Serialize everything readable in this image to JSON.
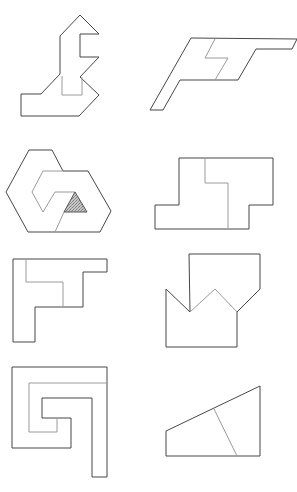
{
  "figure": {
    "colors": {
      "background": "#ffffff",
      "outline": "#474747",
      "inner_line": "#9a9a9a",
      "shaded_fill": "#b8b8b8"
    },
    "shapes": [
      {
        "id": "shape-1",
        "outline": "80,15 99,34 80,34 80,57 99,57 80,77 99,95 79,116 21,116 21,94 41,94 60,74 60,36",
        "inner": [
          "62,76 62,95 82,95 82,77"
        ]
      },
      {
        "id": "shape-2",
        "outline": "191,38 297,39 292,49 256,49 238,80 180,80 163,110 150,110",
        "inner": [
          "215,39 205,58 228,58 215,80"
        ]
      },
      {
        "id": "shape-3",
        "outline": "29,150 52,150 63,171 88,171 111,211 100,232 28,232 6,192",
        "inner": [
          "63,171 43,171 32,192 43,212 55,192 75,192",
          "64,212 55,232"
        ],
        "shaded_triangle": "75,192 64,212 87,212"
      },
      {
        "id": "shape-4",
        "outline": "179,158 273,158 273,205 249,205 249,229 155,229 155,205 179,205",
        "inner": [
          "205,158 205,183 228,183 228,229"
        ]
      },
      {
        "id": "shape-5",
        "outline": "13,259 107,259 107,272 83,272 83,307 35,307 35,342 13,342",
        "inner": [
          "26,259 26,282 63,282 63,307"
        ]
      },
      {
        "id": "shape-6",
        "outline": "189,254 260,254 260,289 237,312 237,347 166,347 166,289 190,312",
        "inner": [
          "190,312 215,289 237,312"
        ]
      },
      {
        "id": "shape-7",
        "outline": "12,367 107,367 107,477 92,477 92,398 42,398 42,418 71,418 71,448 12,448",
        "inner": [
          "107,383 29,383 29,432 57,432 57,418"
        ]
      },
      {
        "id": "shape-8",
        "outline": "166,431 260,386 260,456 166,456",
        "inner": [
          "214,409 237,456"
        ]
      }
    ]
  }
}
